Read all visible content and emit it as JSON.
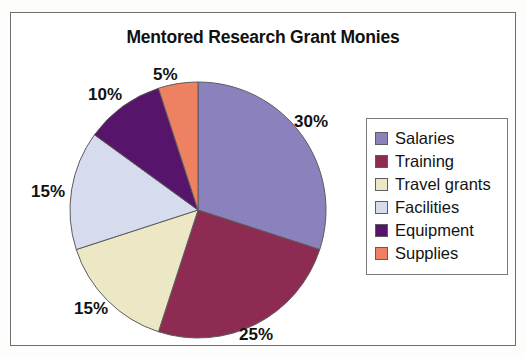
{
  "chart_data": {
    "type": "pie",
    "title": "Mentored Research Grant Monies",
    "categories": [
      "Salaries",
      "Training",
      "Travel grants",
      "Facilities",
      "Equipment",
      "Supplies"
    ],
    "values": [
      30,
      25,
      15,
      15,
      10,
      5
    ],
    "value_labels": [
      "30%",
      "25%",
      "15%",
      "15%",
      "10%",
      "5%"
    ],
    "unit": "%",
    "total": 100,
    "start_angle_deg": 0,
    "direction": "clockwise",
    "legend_position": "right",
    "grid": false,
    "xlabel": "",
    "ylabel": "",
    "colors": {
      "salaries": "#8b82bd",
      "training": "#8e2b52",
      "travel_grants": "#ece8c6",
      "facilities": "#d6dced",
      "equipment": "#56146b",
      "supplies": "#ef8163"
    },
    "slices": [
      {
        "name": "Salaries",
        "value": 30,
        "label": "30%",
        "color": "#8b82bd"
      },
      {
        "name": "Training",
        "value": 25,
        "label": "25%",
        "color": "#8e2b52"
      },
      {
        "name": "Travel grants",
        "value": 15,
        "label": "15%",
        "color": "#ece8c6"
      },
      {
        "name": "Facilities",
        "value": 15,
        "label": "15%",
        "color": "#d6dced"
      },
      {
        "name": "Equipment",
        "value": 10,
        "label": "10%",
        "color": "#56146b"
      },
      {
        "name": "Supplies",
        "value": 5,
        "label": "5%",
        "color": "#ef8163"
      }
    ]
  },
  "title": "Mentored Research Grant Monies",
  "labels": {
    "salaries": "30%",
    "training": "25%",
    "travel_grants": "15%",
    "facilities": "15%",
    "equipment": "10%",
    "supplies": "5%"
  },
  "legend": {
    "items": [
      {
        "label": "Salaries",
        "color": "#8b82bd"
      },
      {
        "label": "Training",
        "color": "#8e2b52"
      },
      {
        "label": "Travel grants",
        "color": "#ece8c6"
      },
      {
        "label": "Facilities",
        "color": "#d6dced"
      },
      {
        "label": "Equipment",
        "color": "#56146b"
      },
      {
        "label": "Supplies",
        "color": "#ef8163"
      }
    ]
  }
}
